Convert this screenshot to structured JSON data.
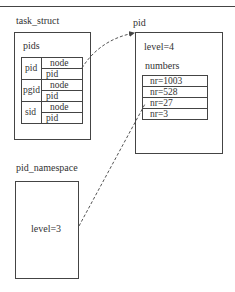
{
  "task_struct": {
    "title": "task_struct",
    "pids_label": "pids",
    "rows": [
      {
        "name": "pid",
        "fields": [
          "node",
          "pid"
        ]
      },
      {
        "name": "pgid",
        "fields": [
          "node",
          "pid"
        ]
      },
      {
        "name": "sid",
        "fields": [
          "node",
          "pid"
        ]
      }
    ]
  },
  "pid": {
    "title": "pid",
    "level": "level=4",
    "numbers_label": "numbers",
    "numbers": [
      "nr=1003",
      "nr=528",
      "nr=27",
      "nr=3"
    ]
  },
  "pid_namespace": {
    "title": "pid_namespace",
    "level": "level=3"
  },
  "connectors": [
    {
      "from": "task_struct.pids.pid.node",
      "to": "pid",
      "style": "dashed-curved-arrow"
    },
    {
      "from": "pid_namespace",
      "to": "pid.numbers.nr=27",
      "style": "dashed-line"
    }
  ],
  "colors": {
    "line": "#444444",
    "text": "#333333",
    "background": "#ffffff"
  }
}
